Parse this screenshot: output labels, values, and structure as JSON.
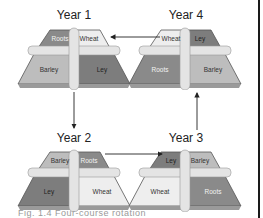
{
  "diagram": {
    "type": "crop-rotation-cycle",
    "colors": {
      "roots": "#8a8a8a",
      "wheat": "#eeeeee",
      "barley": "#bdbdbd",
      "ley": "#7d7d7d",
      "path": "#e4e4e4",
      "edge": "#555555",
      "arrow": "#222222"
    },
    "fields": [
      {
        "title": "Year 1",
        "back_left": "Roots",
        "back_right": "Wheat",
        "front_left": "Barley",
        "front_right": "Ley"
      },
      {
        "title": "Year 4",
        "back_left": "Wheat",
        "back_right": "Ley",
        "front_left": "Roots",
        "front_right": "Barley"
      },
      {
        "title": "Year 2",
        "back_left": "Barley",
        "back_right": "Roots",
        "front_left": "Ley",
        "front_right": "Wheat"
      },
      {
        "title": "Year 3",
        "back_left": "Ley",
        "back_right": "Barley",
        "front_left": "Wheat",
        "front_right": "Roots"
      }
    ],
    "arrows": [
      {
        "from": "Year 1",
        "to": "Year 2",
        "direction": "down"
      },
      {
        "from": "Year 2",
        "to": "Year 3",
        "direction": "right"
      },
      {
        "from": "Year 3",
        "to": "Year 4",
        "direction": "up"
      },
      {
        "from": "Year 4",
        "to": "Year 1",
        "direction": "left"
      }
    ],
    "caption": "Fig. 1.4  Four-course rotation"
  }
}
